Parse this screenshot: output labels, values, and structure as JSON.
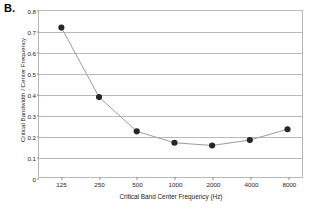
{
  "figure": {
    "panel_label": "B."
  },
  "chart_data": {
    "type": "line",
    "title": "",
    "xlabel": "Critical Band Center Frequency (Hz)",
    "ylabel": "Critical Bandwidth / Center Frequency",
    "categories": [
      "125",
      "250",
      "500",
      "1000",
      "2000",
      "4000",
      "8000"
    ],
    "x_numeric": [
      125,
      250,
      500,
      1000,
      2000,
      4000,
      8000
    ],
    "x_scale": "log2-categorical",
    "values": [
      0.72,
      0.385,
      0.22,
      0.165,
      0.152,
      0.178,
      0.23
    ],
    "ylim": [
      0,
      0.8
    ],
    "ytick_labels": [
      "0",
      "0.1",
      "0.2",
      "0.3",
      "0.4",
      "0.5",
      "0.6",
      "0.7",
      "0.8"
    ],
    "ytick_values": [
      0,
      0.1,
      0.2,
      0.3,
      0.4,
      0.5,
      0.6,
      0.7,
      0.8
    ],
    "grid": "horizontal",
    "legend": "none",
    "marker": "filled-circle",
    "marker_color": "#262626",
    "line_color": "#9a9a9a",
    "grid_color": "#b9b9b9",
    "series": [
      {
        "name": "Critical Bandwidth / Center Frequency",
        "values": [
          0.72,
          0.385,
          0.22,
          0.165,
          0.152,
          0.178,
          0.23
        ]
      }
    ]
  }
}
